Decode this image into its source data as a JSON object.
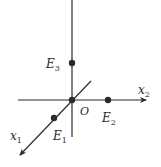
{
  "diagram": {
    "title": "",
    "origin": {
      "label": "O"
    },
    "axes": [
      {
        "id": "x1",
        "label": "x",
        "subscript": "1",
        "direction": "diagonal-down-left"
      },
      {
        "id": "x2",
        "label": "x",
        "subscript": "2",
        "direction": "right"
      },
      {
        "id": "x3",
        "label": "",
        "subscript": "",
        "direction": "up"
      }
    ],
    "points": [
      {
        "id": "E1",
        "label": "E",
        "subscript": "1",
        "on_axis": "x1"
      },
      {
        "id": "E2",
        "label": "E",
        "subscript": "2",
        "on_axis": "x2"
      },
      {
        "id": "E3",
        "label": "E",
        "subscript": "3",
        "on_axis": "x3"
      }
    ],
    "colors": {
      "stroke": "#2b2b2b",
      "background": "#ffffff"
    }
  }
}
